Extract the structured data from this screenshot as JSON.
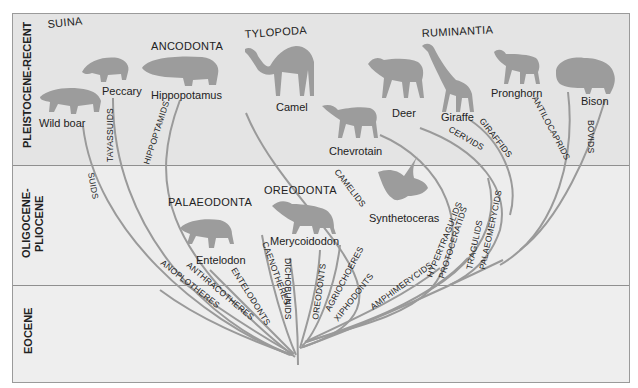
{
  "eras": [
    {
      "label": "PLEISTOCENE-RECENT"
    },
    {
      "label": "OLIGOCENE-",
      "label2": "PLIOCENE"
    },
    {
      "label": "EOCENE"
    }
  ],
  "groups": {
    "suina": "SUINA",
    "ancodonta": "ANCODONTA",
    "tylopoda": "TYLOPODA",
    "ruminantia": "RUMINANTIA",
    "palaeodonta": "PALAEODONTA",
    "oreodonta": "OREODONTA"
  },
  "animals": {
    "wild_boar": "Wild boar",
    "peccary": "Peccary",
    "hippopotamus": "Hippopotamus",
    "camel": "Camel",
    "chevrotain": "Chevrotain",
    "deer": "Deer",
    "giraffe": "Giraffe",
    "pronghorn": "Pronghorn",
    "bison": "Bison",
    "entelodon": "Entelodon",
    "merycoidodon": "Merycoidodon",
    "synthetoceras": "Synthetoceras"
  },
  "families": {
    "suids": "SUIDS",
    "tayassuids": "TAYASSUIDS",
    "hippopotamids": "HIPPOPTAMIDS",
    "anoplotheres": "ANOPLOTHERES",
    "anthracotheres": "ANTHRACOTHERES",
    "entelodonts": "ENTELODONTS",
    "caenotheres": "CAENOTHERES",
    "dichobunids": "DICHOBUNIDS",
    "oreodonts": "OREODONTS",
    "agriochoeres": "AGRIOCHOERES",
    "xiphodonts": "XIPHODONTS",
    "camelids": "CAMELIDS",
    "amphimeryids": "AMPHIMERYCIDS",
    "hypertragulids": "HYPERTRAGULIDS",
    "protoceratids": "PROTOCERATIDS",
    "tragulids": "TRAGULIDS",
    "palaeomerycids": "PALAEOMERYCIDS",
    "cervids": "CERVIDS",
    "giraffids": "GIRAFFIDS",
    "antilocaprids": "ANTILOCAPRIDS",
    "bovids": "BOVIDS"
  },
  "colors": {
    "branch": "#9a9a9a",
    "silhouette": "#9c9c9c",
    "band_top": "#e4e4e4",
    "band_lower": "#ededed",
    "text": "#222222"
  }
}
